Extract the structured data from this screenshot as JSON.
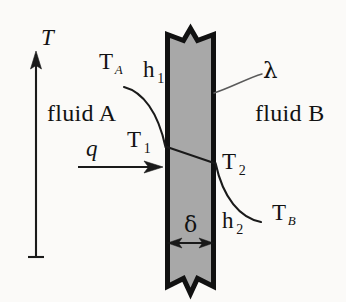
{
  "figure": {
    "background_color": "#fbfaf8",
    "wall_fill_color": "#a8a8a8",
    "wall_stroke_color": "#111111",
    "line_color": "#1a1a1a",
    "leader_color": "#555555"
  },
  "axis": {
    "name": "temperature-axis",
    "label": "T",
    "orientation": "vertical",
    "arrow_direction": "up"
  },
  "regions": {
    "left_fluid_label": "fluid A",
    "right_fluid_label": "fluid B"
  },
  "labels": {
    "T_A": {
      "base": "T",
      "sub": "A"
    },
    "T_B": {
      "base": "T",
      "sub": "B"
    },
    "T_1": {
      "base": "T",
      "sub": "1"
    },
    "T_2": {
      "base": "T",
      "sub": "2"
    },
    "h_1": {
      "base": "h",
      "sub": "1"
    },
    "h_2": {
      "base": "h",
      "sub": "2"
    },
    "lambda": "λ",
    "delta": "δ",
    "q": "q"
  },
  "annotations": {
    "heat_flux_symbol": "q",
    "wall_thickness_symbol": "δ",
    "conductivity_symbol": "λ",
    "inner_surface_temp": "T1",
    "outer_surface_temp": "T2",
    "bulk_temp_a": "TA",
    "bulk_temp_b": "TB",
    "film_coefficient_a": "h1",
    "film_coefficient_b": "h2"
  },
  "geometry": {
    "wall_left_x": 166,
    "wall_right_x": 215,
    "wall_top_y": 38,
    "wall_bottom_y": 288,
    "axis_x": 36,
    "axis_top_y": 52,
    "axis_bottom_y": 258,
    "profile_left_y": 147,
    "profile_right_y": 163,
    "q_arrow_y": 167,
    "delta_arrow_y": 243
  }
}
